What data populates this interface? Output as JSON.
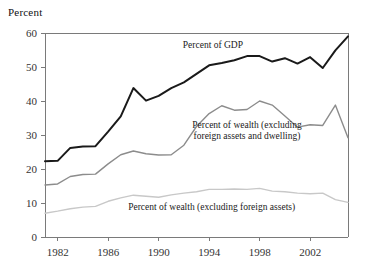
{
  "figure": {
    "axis_title": "Percent"
  },
  "chart_data": {
    "type": "line",
    "title": "",
    "subtitle": "",
    "xlabel": "",
    "ylabel": "Percent",
    "xlim": [
      1981,
      2005
    ],
    "ylim": [
      0,
      60
    ],
    "yticks": [
      0,
      10,
      20,
      30,
      40,
      50,
      60
    ],
    "xticks": [
      1982,
      1986,
      1990,
      1994,
      1998,
      2002
    ],
    "grid": false,
    "legend_position": "inline-annotations",
    "x": [
      1981,
      1982,
      1983,
      1984,
      1985,
      1986,
      1987,
      1988,
      1989,
      1990,
      1991,
      1992,
      1993,
      1994,
      1995,
      1996,
      1997,
      1998,
      1999,
      2000,
      2001,
      2002,
      2003,
      2004,
      2005
    ],
    "series": [
      {
        "name": "Percent of GDP",
        "color": "#1a1a1a",
        "width": 2.0,
        "label": "Percent of GDP",
        "label_x": 1994.3,
        "label_y": 55.5,
        "values": [
          22.3,
          22.4,
          26.2,
          26.6,
          26.7,
          31.0,
          35.5,
          43.8,
          40.1,
          41.5,
          43.8,
          45.5,
          48.0,
          50.5,
          51.2,
          52.0,
          53.2,
          53.2,
          51.6,
          52.6,
          51.0,
          52.9,
          49.7,
          54.9,
          59.0
        ]
      },
      {
        "name": "Percent of wealth (excluding foreign assets and dwelling)",
        "color": "#8c8c8c",
        "width": 1.4,
        "label": "Percent of wealth (excluding\nforeign assets and dwelling)",
        "label_x": 1997.0,
        "label_y": 31.5,
        "values": [
          15.3,
          15.6,
          17.8,
          18.4,
          18.5,
          21.5,
          24.2,
          25.3,
          24.5,
          24.1,
          24.2,
          27.0,
          32.5,
          36.3,
          38.6,
          37.3,
          37.5,
          40.0,
          38.8,
          35.6,
          32.3,
          33.0,
          32.8,
          38.8,
          29.2
        ]
      },
      {
        "name": "Percent of wealth (excluding foreign assets)",
        "color": "#c8c8c8",
        "width": 1.4,
        "label": "Percent of wealth (excluding foreign assets)",
        "label_x": 1994.2,
        "label_y": 8.0,
        "values": [
          7.0,
          7.6,
          8.3,
          8.8,
          9.0,
          10.5,
          11.5,
          12.3,
          12.0,
          11.7,
          12.4,
          12.9,
          13.3,
          14.0,
          14.0,
          14.1,
          14.0,
          14.3,
          13.5,
          13.3,
          12.9,
          12.7,
          12.9,
          11.0,
          10.2
        ]
      }
    ],
    "annotations": [
      {
        "name": "percent-of-gdp-label",
        "lines": [
          "Percent of GDP"
        ],
        "x": 1994.3,
        "y": 55.5
      },
      {
        "name": "percent-of-wealth-ex-foreign-dwelling-label",
        "lines": [
          "Percent of wealth (excluding",
          "foreign assets and dwelling)"
        ],
        "x": 1997.0,
        "y": 32.0
      },
      {
        "name": "percent-of-wealth-ex-foreign-label",
        "lines": [
          "Percent of wealth (excluding foreign assets)"
        ],
        "x": 1994.2,
        "y": 8.0
      }
    ]
  }
}
